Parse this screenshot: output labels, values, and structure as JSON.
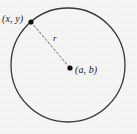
{
  "figure": {
    "kind": "geometry-diagram",
    "canvas": {
      "width": 137,
      "height": 134,
      "background_color": "#f7f7f5"
    },
    "colors": {
      "stroke": "#3a3a3a",
      "dashed_stroke": "#6b6b6b",
      "point_fill": "#101010",
      "text": "#1a1a1a"
    },
    "circle": {
      "center_x": 68,
      "center_y": 65,
      "radius": 57,
      "stroke_width": 1.3,
      "fill": "none"
    },
    "points": [
      {
        "id": "point-on-circle",
        "label": "(x, y)",
        "cx": 31,
        "cy": 22,
        "dot_radius": 2.6,
        "label_x": 2,
        "label_y": 13
      },
      {
        "id": "center-point",
        "label": "(a, b)",
        "cx": 70,
        "cy": 68,
        "dot_radius": 2.6,
        "label_x": 75,
        "label_y": 64
      }
    ],
    "radius_segment": {
      "label": "r",
      "x1": 31,
      "y1": 22,
      "x2": 70,
      "y2": 68,
      "stroke_width": 1,
      "dash_pattern": "2.2 2.2",
      "label_x": 53,
      "label_y": 33
    }
  }
}
